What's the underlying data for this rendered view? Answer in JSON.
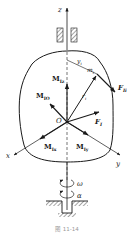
{
  "figure": {
    "caption": "图 11-14",
    "labels": {
      "z_axis": "z",
      "x_axis": "x",
      "y_axis": "y",
      "origin": "O",
      "y_i": "y",
      "y_i_sub": "i",
      "m_i": "m",
      "m_i_sub": "i",
      "r_i": "r",
      "r_i_sub": "i",
      "F_Ii": "F",
      "F_Ii_sub": "Ii",
      "F_I": "F",
      "F_I_sub": "I",
      "M_Iz": "M",
      "M_Iz_sub": "Iz",
      "M_IO": "M",
      "M_IO_sub": "IO",
      "M_Ix": "M",
      "M_Ix_sub": "Ix",
      "M_Iy": "M",
      "M_Iy_sub": "Iy",
      "omega": "ω",
      "alpha": "α"
    },
    "colors": {
      "ink": "#1a1a1a",
      "caption": "#9a9a9a"
    }
  }
}
